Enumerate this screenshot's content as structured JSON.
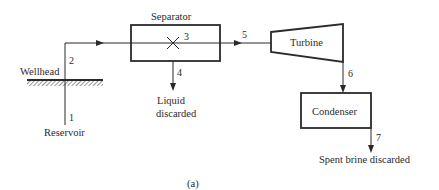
{
  "figure": {
    "caption": "(a)",
    "components": {
      "wellhead": {
        "label": "Wellhead"
      },
      "reservoir": {
        "label": "Reservoir"
      },
      "separator": {
        "label": "Separator"
      },
      "turbine": {
        "label": "Turbine"
      },
      "condenser": {
        "label": "Condenser"
      },
      "liquid_out": {
        "label_line1": "Liquid",
        "label_line2": "discarded"
      },
      "brine_out": {
        "label": "Spent brine discarded"
      }
    },
    "states": {
      "s1": "1",
      "s2": "2",
      "s3": "3",
      "s4": "4",
      "s5": "5",
      "s6": "6",
      "s7": "7"
    },
    "colors": {
      "stroke": "#2a2a2a",
      "background": "#ffffff"
    }
  }
}
